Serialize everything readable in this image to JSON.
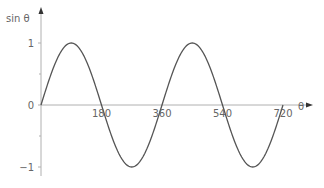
{
  "chart_data": {
    "type": "line",
    "title": "",
    "xlabel": "θ",
    "ylabel": "sin θ",
    "x_ticks": [
      180,
      360,
      540,
      720
    ],
    "x_tick_labels": [
      "180",
      "360",
      "540",
      "720"
    ],
    "y_ticks": [
      1,
      0,
      -1
    ],
    "y_tick_labels": [
      "1",
      "0",
      "−1"
    ],
    "y_minor_ticks": [
      0.5,
      -0.5
    ],
    "xlim": [
      0,
      750
    ],
    "ylim": [
      -1.1,
      1.3
    ],
    "grid": false,
    "legend": null,
    "series": [
      {
        "name": "sin θ",
        "function": "sin",
        "x": [
          0,
          90,
          180,
          270,
          360,
          450,
          540,
          630,
          720
        ],
        "values": [
          0,
          1,
          0,
          -1,
          0,
          1,
          0,
          -1,
          0
        ]
      }
    ],
    "colors": {
      "curve": "#555555",
      "axis": "#b0b0b0",
      "text": "#666666",
      "arrow": "#333333"
    }
  }
}
